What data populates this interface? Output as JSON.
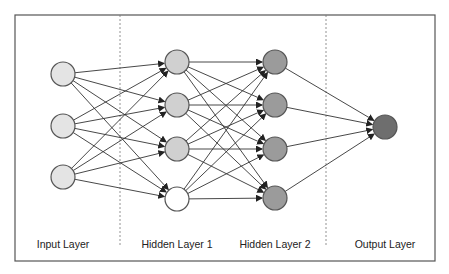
{
  "diagram": {
    "frame": {
      "x": 15,
      "y": 15,
      "width": 420,
      "height": 246,
      "stroke": "#555555"
    },
    "dividers": [
      {
        "x": 120
      },
      {
        "x": 326
      }
    ],
    "node_radius": 12,
    "layers": [
      {
        "label": "Input Layer",
        "label_x": 63,
        "fill": "#e4e4e4",
        "nodes": [
          {
            "x": 63,
            "y": 74
          },
          {
            "x": 63,
            "y": 126
          },
          {
            "x": 63,
            "y": 177
          }
        ]
      },
      {
        "label": "Hidden Layer 1",
        "label_x": 177,
        "fill": "#d0d0d0",
        "nodes": [
          {
            "x": 177,
            "y": 62
          },
          {
            "x": 177,
            "y": 105
          },
          {
            "x": 177,
            "y": 149
          },
          {
            "x": 177,
            "y": 199,
            "fill": "#ffffff",
            "role": "bias"
          }
        ]
      },
      {
        "label": "Hidden Layer 2",
        "label_x": 275,
        "fill": "#9b9b9b",
        "nodes": [
          {
            "x": 275,
            "y": 62
          },
          {
            "x": 275,
            "y": 105
          },
          {
            "x": 275,
            "y": 149
          },
          {
            "x": 275,
            "y": 198
          }
        ]
      },
      {
        "label": "Output Layer",
        "label_x": 385,
        "fill": "#6e6e6e",
        "nodes": [
          {
            "x": 385,
            "y": 127
          }
        ]
      }
    ],
    "connections": "fully-connected between consecutive layers, arrows pointing right",
    "edge_color": "#333333",
    "node_stroke": "#555555"
  }
}
